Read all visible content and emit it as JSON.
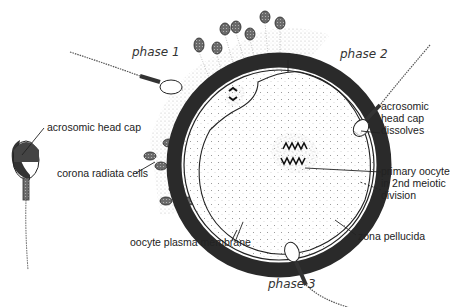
{
  "diagram": {
    "phases": {
      "phase1": "phase 1",
      "phase2": "phase 2",
      "phase3": "phase 3"
    },
    "labels": {
      "acrosomic_head_cap": "acrosomic head cap",
      "corona_radiata_cells": "corona radiata cells",
      "oocyte_plasma_membrane": "oocyte plasma membrane",
      "acrosomic_dissolves_1": "acrosomic",
      "acrosomic_dissolves_2": "head cap",
      "acrosomic_dissolves_3": "dissolves",
      "primary_oocyte_1": "primary oocyte",
      "primary_oocyte_2": "in 2nd meiotic",
      "primary_oocyte_3": "division",
      "zona_pellucida": "zona pellucida"
    },
    "colors": {
      "ink": "#222222",
      "zona": "#2a2a2a",
      "stipple": "#9a9a9a",
      "background": "#ffffff"
    }
  }
}
